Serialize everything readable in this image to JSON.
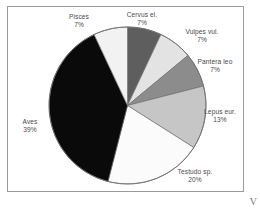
{
  "figure": {
    "corner_glyph": "V",
    "frame_color": "#9a9a9a",
    "background_color": "#ffffff",
    "label_color": "#4a4a4a"
  },
  "chart_data": {
    "type": "pie",
    "title": "",
    "subtitle": "",
    "xlabel": "",
    "ylabel": "",
    "legend_position": "none",
    "grid": false,
    "units": "percent",
    "start_angle_deg": 0,
    "direction": "clockwise",
    "total": 100,
    "categories": [
      "Cervus el.",
      "Vulpes vul.",
      "Pantera leo",
      "Lepus eur.",
      "Testudo sp.",
      "Aves",
      "Pisces"
    ],
    "values": [
      7,
      7,
      7,
      13,
      20,
      39,
      7
    ],
    "slices": [
      {
        "label": "Cervus el.",
        "value": 7,
        "percent_text": "7%",
        "color": "#5e5e5e",
        "start_deg": 0,
        "end_deg": 25.2
      },
      {
        "label": "Vulpes vul.",
        "value": 7,
        "percent_text": "7%",
        "color": "#e3e3e3",
        "start_deg": 25.2,
        "end_deg": 50.4
      },
      {
        "label": "Pantera leo",
        "value": 7,
        "percent_text": "7%",
        "color": "#8c8c8c",
        "start_deg": 50.4,
        "end_deg": 75.6
      },
      {
        "label": "Lepus eur.",
        "value": 13,
        "percent_text": "13%",
        "color": "#c6c6c6",
        "start_deg": 75.6,
        "end_deg": 122.4
      },
      {
        "label": "Testudo sp.",
        "value": 20,
        "percent_text": "20%",
        "color": "#fbfbfb",
        "start_deg": 122.4,
        "end_deg": 194.4
      },
      {
        "label": "Aves",
        "value": 39,
        "percent_text": "39%",
        "color": "#0a0a0a",
        "start_deg": 194.4,
        "end_deg": 334.8
      },
      {
        "label": "Pisces",
        "value": 7,
        "percent_text": "7%",
        "color": "#f2f2f2",
        "start_deg": 334.8,
        "end_deg": 360
      }
    ]
  }
}
